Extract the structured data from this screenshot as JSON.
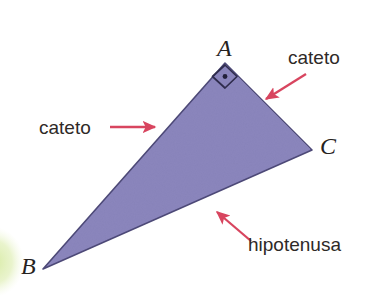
{
  "figure": {
    "type": "geometry-diagram",
    "language": "pt",
    "background_color": "#ffffff"
  },
  "colors": {
    "triangle_fill": "#8b86bd",
    "triangle_stroke": "#4e4a79",
    "arrow": "#d8455f",
    "text": "#2b2724",
    "corner_blob": "#dcecab"
  },
  "triangle": {
    "name": "triangle-ABC",
    "vertices": [
      {
        "label": "A",
        "x": 225,
        "y": 63
      },
      {
        "label": "C",
        "x": 312,
        "y": 150
      },
      {
        "label": "B",
        "x": 43,
        "y": 269
      }
    ],
    "right_angle_at": "A"
  },
  "vertex_labels": {
    "a": "A",
    "b": "B",
    "c": "C"
  },
  "annotations": [
    {
      "id": "cateto-left",
      "text": "cateto",
      "target_side": "AB",
      "arrow": {
        "x1": 110,
        "y1": 127,
        "x2": 160,
        "y2": 127
      }
    },
    {
      "id": "cateto-right",
      "text": "cateto",
      "target_side": "AC",
      "arrow": {
        "x1": 306,
        "y1": 74,
        "x2": 263,
        "y2": 101
      }
    },
    {
      "id": "hipotenusa",
      "text": "hipotenusa",
      "target_side": "BC",
      "arrow": {
        "x1": 251,
        "y1": 241,
        "x2": 214,
        "y2": 209
      }
    }
  ],
  "decorations": {
    "corner_blob": {
      "name": "green-circle-fragment",
      "cx": -6,
      "cy": 262,
      "rx": 28,
      "ry": 33
    }
  }
}
